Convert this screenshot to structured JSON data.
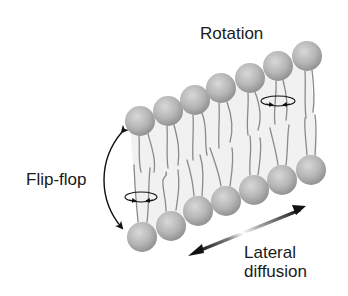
{
  "diagram": {
    "type": "lipid-bilayer-motion",
    "labels": {
      "rotation": "Rotation",
      "flip_flop": "Flip-flop",
      "lateral_line1": "Lateral",
      "lateral_line2": "diffusion"
    },
    "colors": {
      "head": "#b4b4b4",
      "head_highlight": "#d6d6d6",
      "head_shadow": "#8e8e8e",
      "tail": "#8a8a8a",
      "membrane_fill": "#f1f1f1",
      "arrow": "#111111",
      "text": "#1a1a1a",
      "background": "#ffffff"
    },
    "top_heads": [
      {
        "cx": 140,
        "cy": 121
      },
      {
        "cx": 168,
        "cy": 111
      },
      {
        "cx": 195,
        "cy": 100
      },
      {
        "cx": 221,
        "cy": 88
      },
      {
        "cx": 250,
        "cy": 78
      },
      {
        "cx": 278,
        "cy": 66
      },
      {
        "cx": 307,
        "cy": 56
      }
    ],
    "bottom_heads": [
      {
        "cx": 142,
        "cy": 237
      },
      {
        "cx": 171,
        "cy": 226
      },
      {
        "cx": 198,
        "cy": 211
      },
      {
        "cx": 226,
        "cy": 201
      },
      {
        "cx": 254,
        "cy": 190
      },
      {
        "cx": 282,
        "cy": 180
      },
      {
        "cx": 311,
        "cy": 170
      }
    ],
    "head_radius": 15
  }
}
